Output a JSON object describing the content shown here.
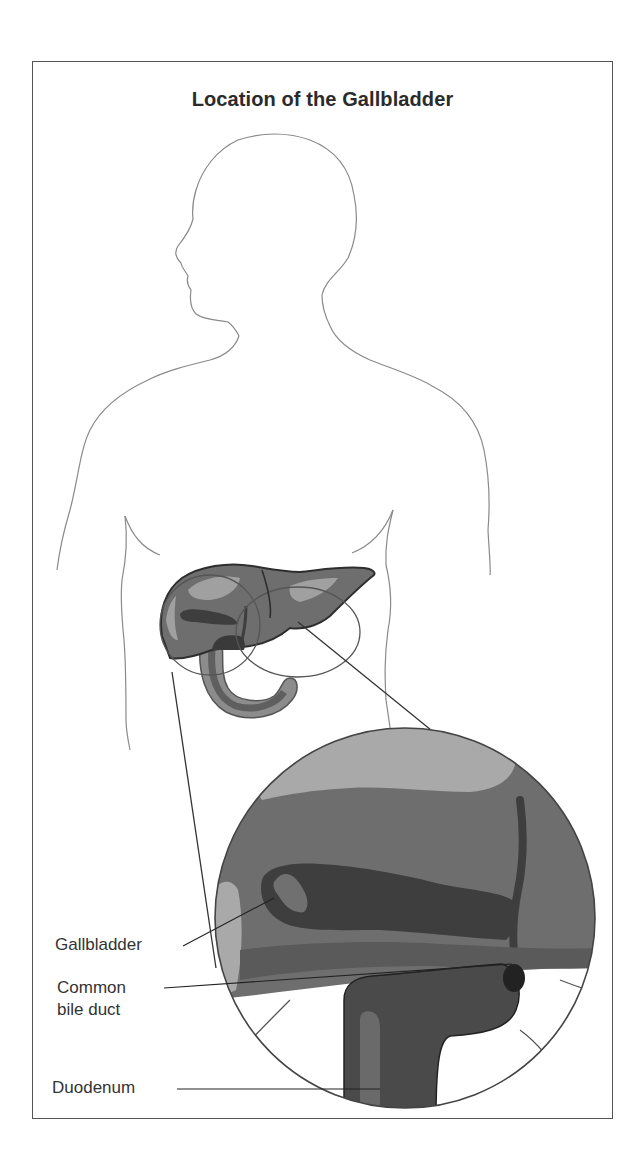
{
  "figure": {
    "title": "Location of the Gallbladder",
    "labels": [
      {
        "id": "gallbladder",
        "text": "Gallbladder"
      },
      {
        "id": "common-bile-duct",
        "line1": "Common",
        "line2": "bile duct"
      },
      {
        "id": "duodenum",
        "text": "Duodenum"
      }
    ]
  },
  "colors": {
    "outline": "#8a8a8a",
    "frame": "#555555",
    "light_gray": "#a9a9a9",
    "mid_gray": "#6e6e6e",
    "dark_gray": "#4a4a4a",
    "darkest": "#2e2e2e",
    "text": "#333333"
  }
}
